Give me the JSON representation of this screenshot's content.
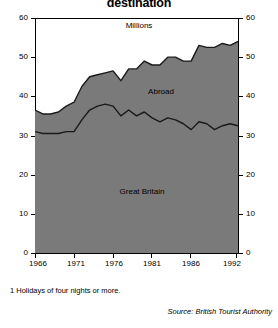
{
  "title": "destination",
  "footnote": "1  Holidays of four nights or more.",
  "source": "Source: British Tourist Authority",
  "labels": {
    "millions": "Millions",
    "abroad": "Abroad",
    "great_britain": "Great Britain"
  },
  "colors": {
    "area_fill": "#7a7a7a",
    "line": "#1a1a1a",
    "axis": "#000000",
    "background": "#ffffff"
  },
  "chart_data": {
    "type": "area",
    "stacked": true,
    "title": "destination",
    "xlabel": "",
    "ylabel": "Millions",
    "ylim": [
      0,
      60
    ],
    "xlim": [
      1966,
      1992
    ],
    "grid": false,
    "legend": "inline-annotations",
    "yticks": [
      0,
      10,
      20,
      30,
      40,
      50,
      60
    ],
    "ytick_labels": [
      "0",
      "10",
      "20",
      "30",
      "40",
      "50",
      "60"
    ],
    "xticks": [
      1966,
      1971,
      1976,
      1981,
      1986,
      1992
    ],
    "xtick_labels": [
      "1966",
      "1971",
      "1976",
      "1981",
      "1986",
      "1992"
    ],
    "x": [
      1966,
      1967,
      1968,
      1969,
      1970,
      1971,
      1972,
      1973,
      1974,
      1975,
      1976,
      1977,
      1978,
      1979,
      1980,
      1981,
      1982,
      1983,
      1984,
      1985,
      1986,
      1987,
      1988,
      1989,
      1990,
      1991,
      1992
    ],
    "series": [
      {
        "name": "Great Britain",
        "values": [
          31.0,
          30.5,
          30.5,
          30.5,
          31.0,
          31.0,
          34.0,
          36.5,
          37.5,
          38.0,
          37.5,
          35.0,
          36.5,
          35.0,
          36.0,
          34.5,
          33.5,
          34.5,
          34.0,
          33.0,
          31.5,
          33.5,
          33.0,
          31.5,
          32.5,
          33.0,
          32.5
        ]
      },
      {
        "name": "Abroad",
        "values": [
          5.5,
          5.0,
          5.0,
          5.5,
          6.5,
          7.5,
          8.5,
          8.5,
          8.0,
          8.0,
          9.0,
          9.0,
          10.5,
          12.0,
          13.0,
          13.5,
          14.5,
          15.5,
          16.0,
          16.0,
          17.5,
          19.5,
          19.5,
          21.0,
          21.0,
          20.0,
          21.5
        ]
      }
    ],
    "totals": [
      36.5,
      35.5,
      35.5,
      36.0,
      37.5,
      38.5,
      42.5,
      45.0,
      45.5,
      46.0,
      46.5,
      44.0,
      47.0,
      47.0,
      49.0,
      48.0,
      48.0,
      50.0,
      50.0,
      49.0,
      49.0,
      53.0,
      52.5,
      52.5,
      53.5,
      53.0,
      54.0
    ],
    "annotations": [
      {
        "text": "Millions",
        "x": 1979,
        "y": 57
      },
      {
        "text": "Abroad",
        "x": 1984,
        "y": 42
      },
      {
        "text": "Great Britain",
        "x": 1975,
        "y": 17
      }
    ]
  }
}
